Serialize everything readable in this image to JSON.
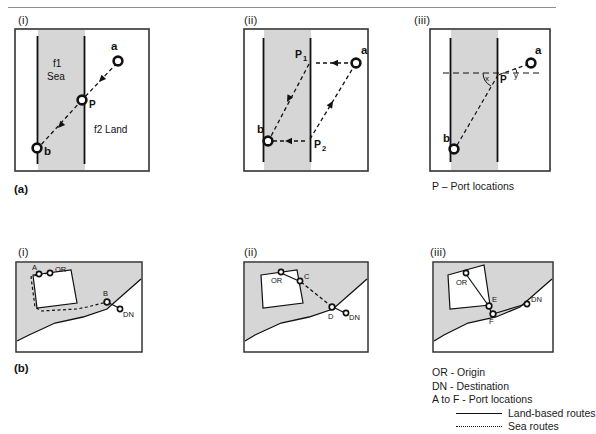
{
  "figure": {
    "rows": [
      {
        "id": "a",
        "row_label": "(a)",
        "caption": "P – Port locations",
        "panels": [
          {
            "id": "a-i",
            "label": "(i)",
            "region_labels": [
              "f1",
              "Sea",
              "f2 Land"
            ],
            "nodes": [
              {
                "name": "a",
                "label": "a"
              },
              {
                "name": "p",
                "label": "P"
              },
              {
                "name": "b",
                "label": "b"
              }
            ]
          },
          {
            "id": "a-ii",
            "label": "(ii)",
            "nodes": [
              {
                "name": "a",
                "label": "a"
              },
              {
                "name": "p1",
                "label": "P",
                "sub": "1"
              },
              {
                "name": "p2",
                "label": "P",
                "sub": "2"
              },
              {
                "name": "b",
                "label": "b"
              }
            ]
          },
          {
            "id": "a-iii",
            "label": "(iii)",
            "nodes": [
              {
                "name": "a",
                "label": "a"
              },
              {
                "name": "p",
                "label": "P"
              },
              {
                "name": "b",
                "label": "b"
              }
            ],
            "angles": [
              {
                "name": "x",
                "label": "x"
              },
              {
                "name": "y",
                "label": "y"
              }
            ]
          }
        ]
      },
      {
        "id": "b",
        "row_label": "(b)",
        "panels": [
          {
            "id": "b-i",
            "label": "(i)",
            "nodes": [
              {
                "name": "port-a",
                "label": "A"
              },
              {
                "name": "origin",
                "label": "OR"
              },
              {
                "name": "port-b",
                "label": "B"
              },
              {
                "name": "destination",
                "label": "DN"
              }
            ]
          },
          {
            "id": "b-ii",
            "label": "(ii)",
            "nodes": [
              {
                "name": "origin",
                "label": "OR"
              },
              {
                "name": "port-c",
                "label": "C"
              },
              {
                "name": "port-d",
                "label": "D"
              },
              {
                "name": "destination",
                "label": "DN"
              }
            ]
          },
          {
            "id": "b-iii",
            "label": "(iii)",
            "nodes": [
              {
                "name": "origin",
                "label": "OR"
              },
              {
                "name": "port-e",
                "label": "E"
              },
              {
                "name": "port-f",
                "label": "F"
              },
              {
                "name": "destination",
                "label": "DN"
              }
            ]
          }
        ],
        "legend": {
          "origin": "OR - Origin",
          "destination": "DN - Destination",
          "ports": "A to F - Port locations",
          "land_routes": "Land-based routes",
          "sea_routes": "Sea routes"
        }
      }
    ]
  },
  "colors": {
    "shade": "#d6d6d6",
    "stroke": "#111111",
    "frame": "#333333",
    "rule": "#8d8d8d"
  }
}
